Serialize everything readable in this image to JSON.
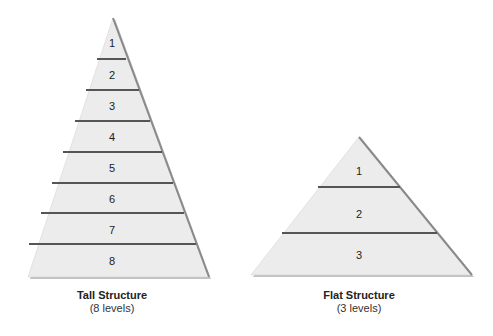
{
  "diagram": {
    "tall": {
      "title": "Tall Structure",
      "subtitle": "(8 levels)",
      "levels": [
        "1",
        "2",
        "3",
        "4",
        "5",
        "6",
        "7",
        "8"
      ]
    },
    "flat": {
      "title": "Flat Structure",
      "subtitle": "(3 levels)",
      "levels": [
        "1",
        "2",
        "3"
      ]
    },
    "colors": {
      "fill": "#ececec",
      "divider": "#555555",
      "edge_shadow": "#8a8a8a",
      "rule": "#444444"
    }
  }
}
